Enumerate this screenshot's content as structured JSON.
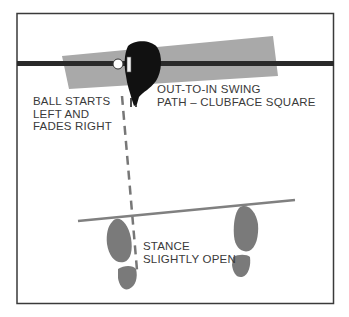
{
  "diagram": {
    "labels": {
      "ball_flight": [
        "BALL STARTS",
        "LEFT AND",
        "FADES RIGHT"
      ],
      "swing_path": [
        "OUT-TO-IN SWING",
        "PATH – CLUBFACE SQUARE"
      ],
      "stance": [
        "STANCE",
        "SLIGHTLY OPEN"
      ]
    },
    "colors": {
      "frame": "#3a3a3a",
      "target_line": "#2a2a2a",
      "swing_band": "#a9a9a9",
      "stance_line": "#808080",
      "feet": "#7a7a7a",
      "club_head": "#111111",
      "ball": "#ffffff",
      "dashed_path": "#777777",
      "text": "#3a3a3a"
    },
    "elements": [
      {
        "name": "target-line",
        "type": "line"
      },
      {
        "name": "swing-path-band",
        "type": "shaded-band"
      },
      {
        "name": "golf-ball",
        "type": "circle"
      },
      {
        "name": "club-head",
        "type": "shape"
      },
      {
        "name": "ball-flight-dashed-line",
        "type": "dashed-line"
      },
      {
        "name": "stance-line",
        "type": "line"
      },
      {
        "name": "left-foot",
        "type": "footprint"
      },
      {
        "name": "right-foot",
        "type": "footprint"
      }
    ]
  }
}
